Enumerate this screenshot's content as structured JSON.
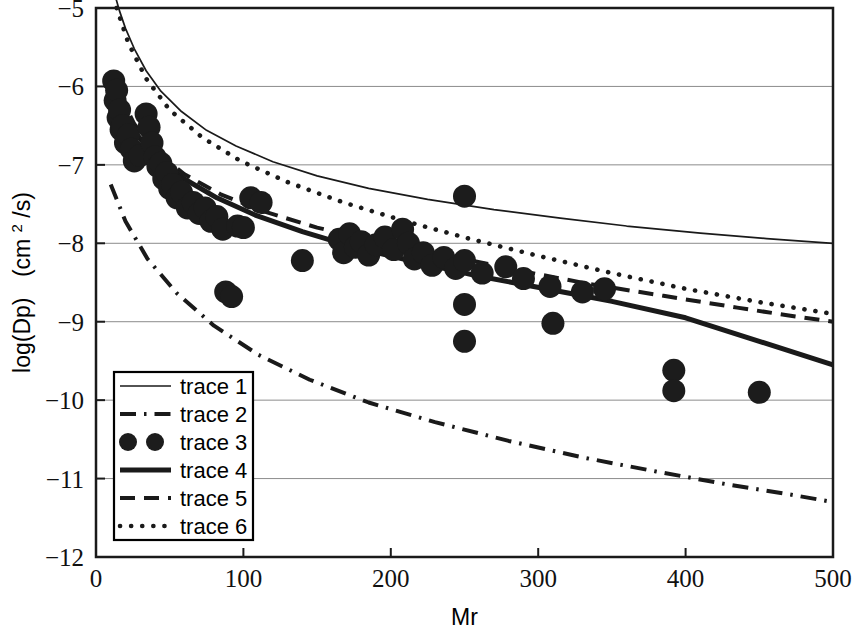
{
  "chart_data": {
    "type": "scatter",
    "title": "",
    "xlabel": "Mr",
    "ylabel": "log(Dp)  (cm2/s)",
    "ylabel_display": "log(Dp)  (cm²/s)",
    "xlim": [
      0,
      500
    ],
    "ylim": [
      -12,
      -5
    ],
    "xticks": [
      0,
      100,
      200,
      300,
      400,
      500
    ],
    "yticks": [
      -12,
      -11,
      -10,
      -9,
      -8,
      -7,
      -6,
      -5
    ],
    "xtick_labels": [
      "0",
      "100",
      "200",
      "300",
      "400",
      "500"
    ],
    "ytick_labels": [
      "-12",
      "-11",
      "-10",
      "-9",
      "-8",
      "-7",
      "-6",
      "-5"
    ],
    "grid": true,
    "grid_axis": "y",
    "legend_position": "lower-left",
    "legend_entries": [
      {
        "label": "trace 1",
        "style": "solid-thin",
        "kind": "line"
      },
      {
        "label": "trace 2",
        "style": "dash-dot",
        "kind": "line"
      },
      {
        "label": "trace 3",
        "style": "marker-circle",
        "kind": "marker"
      },
      {
        "label": "trace 4",
        "style": "solid-thick",
        "kind": "line"
      },
      {
        "label": "trace 5",
        "style": "dashed",
        "kind": "line"
      },
      {
        "label": "trace 6",
        "style": "dotted",
        "kind": "line"
      }
    ],
    "series": [
      {
        "name": "trace 1",
        "style": "solid-thin",
        "x": [
          8,
          12,
          16,
          20,
          26,
          34,
          44,
          58,
          75,
          95,
          120,
          150,
          185,
          225,
          270,
          315,
          360,
          410,
          455,
          500
        ],
        "y": [
          -4.6,
          -4.78,
          -5.04,
          -5.26,
          -5.52,
          -5.8,
          -6.06,
          -6.32,
          -6.56,
          -6.76,
          -6.96,
          -7.14,
          -7.3,
          -7.44,
          -7.57,
          -7.68,
          -7.78,
          -7.87,
          -7.94,
          -8.0
        ]
      },
      {
        "name": "trace 2",
        "style": "dash-dot",
        "x": [
          10,
          20,
          35,
          55,
          80,
          110,
          145,
          185,
          230,
          280,
          330,
          380,
          430,
          470,
          500
        ],
        "y": [
          -7.25,
          -7.72,
          -8.2,
          -8.64,
          -9.05,
          -9.42,
          -9.74,
          -10.03,
          -10.28,
          -10.52,
          -10.73,
          -10.91,
          -11.08,
          -11.2,
          -11.3
        ]
      },
      {
        "name": "trace 4",
        "style": "solid-thick",
        "x": [
          10,
          18,
          28,
          42,
          60,
          82,
          108,
          140,
          175,
          215,
          260,
          305,
          350,
          400,
          450,
          500
        ],
        "y": [
          -5.93,
          -6.3,
          -6.62,
          -6.92,
          -7.18,
          -7.42,
          -7.64,
          -7.85,
          -8.05,
          -8.23,
          -8.42,
          -8.58,
          -8.74,
          -8.95,
          -9.25,
          -9.55
        ]
      },
      {
        "name": "trace 5",
        "style": "dashed",
        "x": [
          16,
          26,
          40,
          60,
          85,
          115,
          150,
          190,
          235,
          285,
          335,
          385,
          435,
          470,
          500
        ],
        "y": [
          -6.1,
          -6.48,
          -6.82,
          -7.12,
          -7.38,
          -7.6,
          -7.8,
          -7.97,
          -8.14,
          -8.34,
          -8.52,
          -8.67,
          -8.82,
          -8.92,
          -9.0
        ]
      },
      {
        "name": "trace 6",
        "style": "dotted",
        "x": [
          14,
          22,
          34,
          50,
          72,
          98,
          130,
          168,
          210,
          255,
          300,
          350,
          400,
          450,
          500
        ],
        "y": [
          -5.0,
          -5.45,
          -5.9,
          -6.3,
          -6.65,
          -6.95,
          -7.22,
          -7.48,
          -7.72,
          -7.95,
          -8.16,
          -8.38,
          -8.58,
          -8.75,
          -8.9
        ]
      },
      {
        "name": "trace 3",
        "style": "marker-circle",
        "points": [
          [
            12,
            -5.93
          ],
          [
            13,
            -6.18
          ],
          [
            14,
            -6.05
          ],
          [
            15,
            -6.4
          ],
          [
            16,
            -6.3
          ],
          [
            17,
            -6.55
          ],
          [
            18,
            -6.5
          ],
          [
            20,
            -6.72
          ],
          [
            22,
            -6.62
          ],
          [
            24,
            -6.8
          ],
          [
            26,
            -6.95
          ],
          [
            30,
            -6.88
          ],
          [
            34,
            -6.35
          ],
          [
            36,
            -6.52
          ],
          [
            38,
            -6.72
          ],
          [
            40,
            -6.9
          ],
          [
            42,
            -7.02
          ],
          [
            44,
            -6.98
          ],
          [
            46,
            -7.18
          ],
          [
            48,
            -7.1
          ],
          [
            50,
            -7.3
          ],
          [
            52,
            -7.25
          ],
          [
            55,
            -7.42
          ],
          [
            58,
            -7.35
          ],
          [
            62,
            -7.55
          ],
          [
            66,
            -7.48
          ],
          [
            70,
            -7.62
          ],
          [
            74,
            -7.55
          ],
          [
            78,
            -7.72
          ],
          [
            82,
            -7.66
          ],
          [
            86,
            -7.82
          ],
          [
            88,
            -8.62
          ],
          [
            92,
            -8.68
          ],
          [
            96,
            -7.78
          ],
          [
            100,
            -7.8
          ],
          [
            105,
            -7.42
          ],
          [
            112,
            -7.48
          ],
          [
            140,
            -8.22
          ],
          [
            165,
            -7.95
          ],
          [
            168,
            -8.12
          ],
          [
            172,
            -7.88
          ],
          [
            176,
            -8.05
          ],
          [
            180,
            -7.98
          ],
          [
            185,
            -8.15
          ],
          [
            190,
            -8.02
          ],
          [
            196,
            -7.92
          ],
          [
            202,
            -8.08
          ],
          [
            208,
            -7.82
          ],
          [
            212,
            -8.0
          ],
          [
            216,
            -8.2
          ],
          [
            222,
            -8.12
          ],
          [
            228,
            -8.28
          ],
          [
            236,
            -8.18
          ],
          [
            244,
            -8.32
          ],
          [
            250,
            -7.4
          ],
          [
            250,
            -8.22
          ],
          [
            250,
            -8.78
          ],
          [
            250,
            -9.25
          ],
          [
            262,
            -8.38
          ],
          [
            278,
            -8.3
          ],
          [
            290,
            -8.45
          ],
          [
            308,
            -8.55
          ],
          [
            310,
            -9.02
          ],
          [
            330,
            -8.62
          ],
          [
            345,
            -8.58
          ],
          [
            392,
            -9.62
          ],
          [
            392,
            -9.88
          ],
          [
            450,
            -9.9
          ]
        ]
      }
    ]
  },
  "axes": {
    "x_title": "Mr",
    "y_title_main": "log(Dp)",
    "y_title_unit_pre": "(cm",
    "y_title_unit_sup": "2",
    "y_title_unit_post": "/s)"
  },
  "colors": {
    "line": "#1a1a1a",
    "grid": "#8c8c8c",
    "marker": "#1c1c1c",
    "background": "#ffffff"
  }
}
